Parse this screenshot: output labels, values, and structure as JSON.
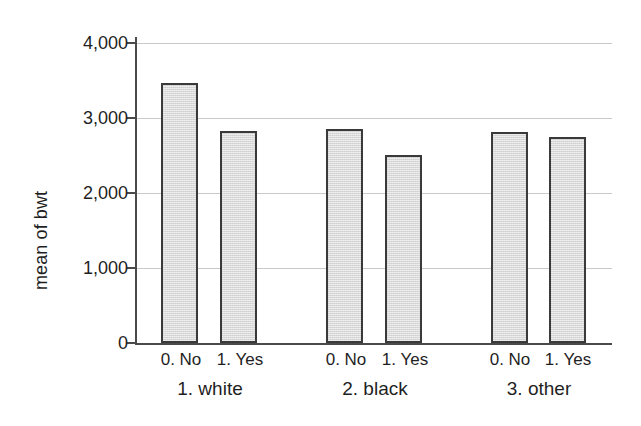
{
  "chart_data": {
    "type": "bar",
    "title": "",
    "subtitle": "",
    "xlabel": "",
    "ylabel": "mean of bwt",
    "ylim": [
      0,
      4000
    ],
    "ytick_labels": [
      "0",
      "1,000",
      "2,000",
      "3,000",
      "4,000"
    ],
    "ytick_values": [
      0,
      1000,
      2000,
      3000,
      4000
    ],
    "grid": "horizontal",
    "legend": "none",
    "categories": [
      "1. white",
      "2. black",
      "3. other"
    ],
    "subcategories": [
      "0. No",
      "1. Yes"
    ],
    "series": [
      {
        "name": "0. No",
        "values": [
          3470,
          2860,
          2810
        ]
      },
      {
        "name": "1. Yes",
        "values": [
          2830,
          2510,
          2750
        ]
      }
    ],
    "bars": [
      {
        "group": "1. white",
        "sub": "0. No",
        "value": 3470
      },
      {
        "group": "1. white",
        "sub": "1. Yes",
        "value": 2830
      },
      {
        "group": "2. black",
        "sub": "0. No",
        "value": 2860
      },
      {
        "group": "2. black",
        "sub": "1. Yes",
        "value": 2510
      },
      {
        "group": "3. other",
        "sub": "0. No",
        "value": 2810
      },
      {
        "group": "3. other",
        "sub": "1. Yes",
        "value": 2750
      }
    ],
    "colors": {
      "bar_fill": "#d9d9d9",
      "bar_border": "#3a3a3a",
      "gridline": "#c9c9c9",
      "axis": "#4a4a4a",
      "background": "#ffffff",
      "text": "#1f1f1f"
    }
  },
  "axis": {
    "y_title": "mean of bwt",
    "ticks": [
      {
        "label": "4,000"
      },
      {
        "label": "3,000"
      },
      {
        "label": "2,000"
      },
      {
        "label": "1,000"
      },
      {
        "label": "0"
      }
    ]
  },
  "x_labels": {
    "sub": [
      {
        "label": "0. No"
      },
      {
        "label": "1. Yes"
      },
      {
        "label": "0. No"
      },
      {
        "label": "1. Yes"
      },
      {
        "label": "0. No"
      },
      {
        "label": "1. Yes"
      }
    ],
    "groups": [
      {
        "label": "1. white"
      },
      {
        "label": "2. black"
      },
      {
        "label": "3. other"
      }
    ]
  }
}
